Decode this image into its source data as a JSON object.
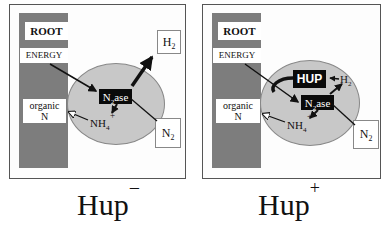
{
  "panels": [
    {
      "id": "hup-minus",
      "caption": {
        "base": "Hup",
        "superscript": "−"
      },
      "labels": {
        "root": "ROOT",
        "energy": "ENERGY",
        "organic": "organic",
        "organic_n": "N",
        "h2": {
          "base": "H",
          "sub": "2"
        },
        "n2": {
          "base": "N",
          "sub": "2"
        },
        "nitrogenase": {
          "base": "N",
          "sub": "2",
          "rest": "ase"
        },
        "ammonium": {
          "base": "NH",
          "sub": "4",
          "sup": "+"
        }
      }
    },
    {
      "id": "hup-plus",
      "caption": {
        "base": "Hup",
        "superscript": "+"
      },
      "labels": {
        "root": "ROOT",
        "energy": "ENERGY",
        "organic": "organic",
        "organic_n": "N",
        "hup": "HUP",
        "h2": {
          "base": "H",
          "sub": "2"
        },
        "n2": {
          "base": "N",
          "sub": "2"
        },
        "nitrogenase": {
          "base": "N",
          "sub": "2",
          "rest": "ase"
        },
        "ammonium": {
          "base": "NH",
          "sub": "4",
          "sup": "+"
        }
      }
    }
  ],
  "colors": {
    "root_column": "#7d7d7d",
    "nodule": "#c8c8c8",
    "enzyme_box": "#0a0a0a",
    "arrow": "#111111"
  }
}
